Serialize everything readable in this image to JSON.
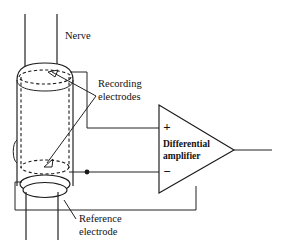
{
  "figure": {
    "background_color": "#ffffff",
    "line_color": "#1a1a1a",
    "width": 283,
    "height": 249
  },
  "labels": {
    "nerve": "Nerve",
    "recording_electrodes_line1": "Recording",
    "recording_electrodes_line2": "electrodes",
    "reference_electrode_line1": "Reference",
    "reference_electrode_line2": "electrode",
    "amplifier_line1": "Differential",
    "amplifier_line2": "amplifier",
    "plus_sign": "+",
    "minus_sign": "−"
  },
  "components": {
    "nerve_bundle": "nerve-cylinder",
    "recording_electrode_upper": "dashed-ring-upper",
    "recording_electrode_lower": "dashed-ring-lower",
    "reference_electrode_ring": "solid-ring",
    "amplifier": "differential-amplifier-triangle",
    "output_wire": "amplifier-output"
  }
}
